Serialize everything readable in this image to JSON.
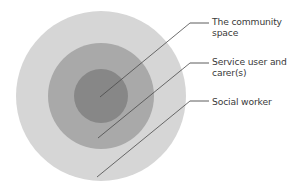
{
  "diagram": {
    "type": "concentric-circles",
    "title": "",
    "background_color": "#ffffff",
    "center": {
      "x": 101,
      "y": 96
    },
    "rings": [
      {
        "id": "outer",
        "name": "The community space",
        "radius": 85,
        "fill": "#d6d6d6",
        "label_text": "The community\nspace"
      },
      {
        "id": "middle",
        "name": "Social worker",
        "radius": 53,
        "fill": "#a9a9a9",
        "label_text": "Service user and\ncarer(s)"
      },
      {
        "id": "inner",
        "name": "Service user and carer(s)",
        "radius": 27,
        "fill": "#878787",
        "label_text": "Social worker"
      }
    ],
    "callouts": [
      {
        "id": "callout-community-space",
        "label": "The community\nspace",
        "label_color": "#3a3a3a",
        "points_to": "inner",
        "anchor": {
          "x": 100,
          "y": 97
        },
        "elbow": {
          "x": 190,
          "y": 23
        },
        "stub_end": {
          "x": 209,
          "y": 23
        }
      },
      {
        "id": "callout-service-user-and-carers",
        "label": "Service user and\ncarer(s)",
        "label_color": "#3a3a3a",
        "points_to": "middle",
        "anchor": {
          "x": 98,
          "y": 138
        },
        "elbow": {
          "x": 190,
          "y": 63
        },
        "stub_end": {
          "x": 209,
          "y": 63
        }
      },
      {
        "id": "callout-social-worker",
        "label": "Social worker",
        "label_color": "#3a3a3a",
        "points_to": "outer",
        "anchor": {
          "x": 97,
          "y": 177
        },
        "elbow": {
          "x": 190,
          "y": 101
        },
        "stub_end": {
          "x": 209,
          "y": 101
        }
      }
    ],
    "line_color": "#4a4a4a",
    "line_width": 0.8
  }
}
